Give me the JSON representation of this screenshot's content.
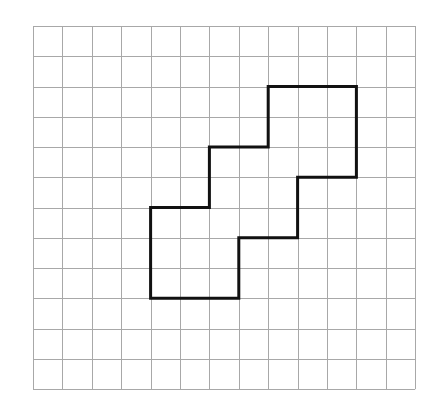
{
  "diagram": {
    "type": "grid-polygon",
    "grid": {
      "cols": 13,
      "rows": 12,
      "origin_x": 33,
      "origin_y": 26,
      "cell_w": 29.4,
      "cell_h": 30.25,
      "line_color": "#a8a8a8",
      "line_width": 1
    },
    "shape": {
      "stroke_color": "#111111",
      "stroke_width": 3,
      "vertices_grid": [
        [
          8,
          2
        ],
        [
          11,
          2
        ],
        [
          11,
          5
        ],
        [
          9,
          5
        ],
        [
          9,
          7
        ],
        [
          7,
          7
        ],
        [
          7,
          9
        ],
        [
          4,
          9
        ],
        [
          4,
          6
        ],
        [
          6,
          6
        ],
        [
          6,
          4
        ],
        [
          8,
          4
        ]
      ]
    }
  }
}
